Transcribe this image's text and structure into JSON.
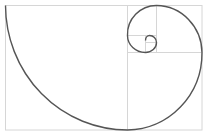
{
  "diagram": {
    "colors": {
      "background": "#ffffff",
      "grid": "#d6d6d6",
      "spiral": "#555555"
    },
    "rectangles": [
      {
        "x": 5,
        "y": 5,
        "w": 197,
        "h": 125
      },
      {
        "x": 127,
        "y": 5,
        "w": 75,
        "h": 48
      },
      {
        "x": 127,
        "y": 5,
        "w": 29,
        "h": 48
      },
      {
        "x": 127,
        "y": 35,
        "w": 29,
        "h": 18
      },
      {
        "x": 145,
        "y": 35,
        "w": 11,
        "h": 18
      }
    ]
  }
}
